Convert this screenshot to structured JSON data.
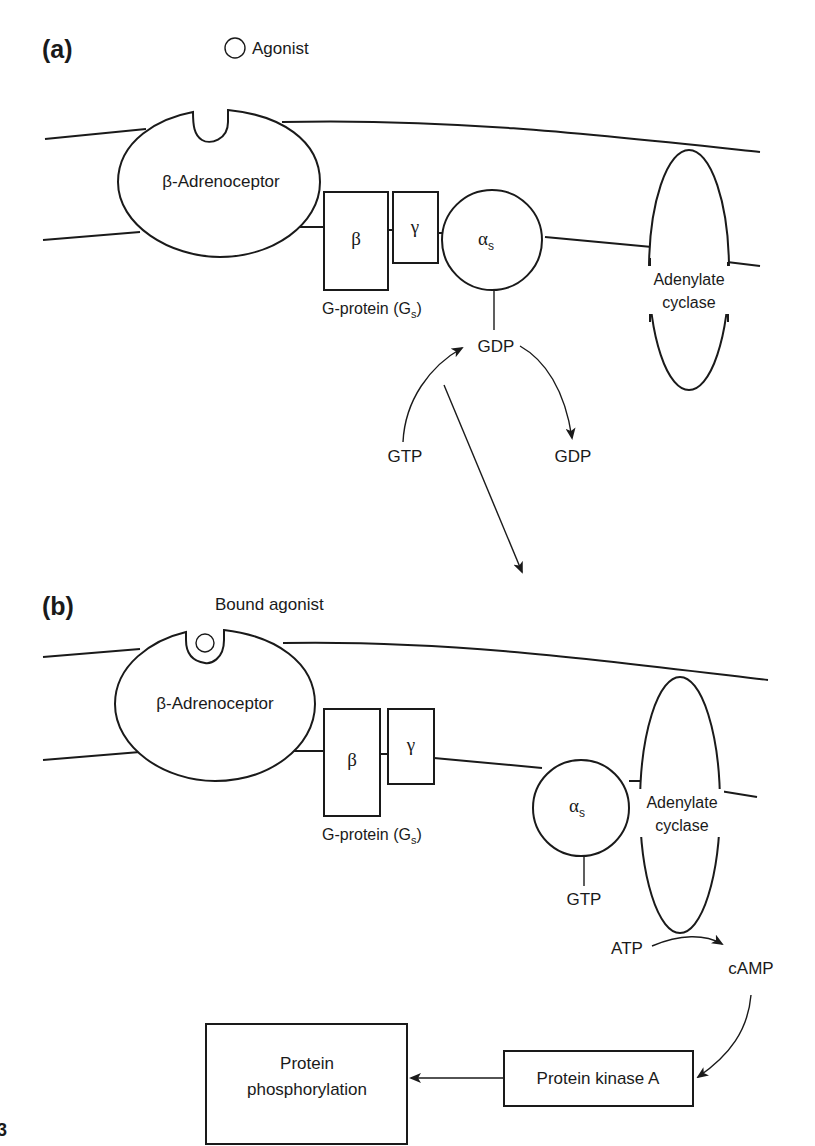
{
  "panel_a": {
    "label": "(a)",
    "agonist_label": "Agonist",
    "receptor_label": "β-Adrenoceptor",
    "g_protein": {
      "beta_label": "β",
      "gamma_label": "γ",
      "alpha_label": "α",
      "alpha_sub": "s",
      "name_prefix": "G-protein (G",
      "name_sub": "s",
      "name_suffix": ")"
    },
    "adenylate_cyclase_line1": "Adenylate",
    "adenylate_cyclase_line2": "cyclase",
    "bound_nucleotide": "GDP",
    "exchange_in": "GTP",
    "exchange_out": "GDP"
  },
  "panel_b": {
    "label": "(b)",
    "agonist_label": "Bound agonist",
    "receptor_label": "β-Adrenoceptor",
    "g_protein": {
      "beta_label": "β",
      "gamma_label": "γ",
      "alpha_label": "α",
      "alpha_sub": "s",
      "name_prefix": "G-protein (G",
      "name_sub": "s",
      "name_suffix": ")"
    },
    "adenylate_cyclase_line1": "Adenylate",
    "adenylate_cyclase_line2": "cyclase",
    "bound_nucleotide": "GTP",
    "substrate": "ATP",
    "product": "cAMP",
    "kinase_label": "Protein kinase A",
    "outcome_line1": "Protein",
    "outcome_line2": "phosphorylation"
  },
  "figure_number_fragment": "3"
}
